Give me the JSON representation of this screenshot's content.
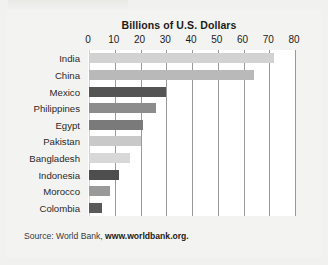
{
  "figure": {
    "source_prefix": "Source: World Bank, ",
    "source_link": "www.worldbank.org."
  },
  "chart_data": {
    "type": "bar",
    "orientation": "horizontal",
    "title": "Billions of U.S. Dollars",
    "xlabel": "",
    "ylabel": "",
    "xlim": [
      0,
      80
    ],
    "xticks": [
      0,
      10,
      20,
      30,
      40,
      50,
      60,
      70,
      80
    ],
    "tick_labels": [
      "0",
      "10",
      "20",
      "30",
      "40",
      "50",
      "60",
      "70",
      "80"
    ],
    "grid": true,
    "legend": "none",
    "categories": [
      "India",
      "China",
      "Mexico",
      "Philippines",
      "Egypt",
      "Pakistan",
      "Bangladesh",
      "Indonesia",
      "Morocco",
      "Colombia"
    ],
    "values": [
      72,
      64,
      30,
      26,
      21,
      20,
      16,
      11.5,
      8,
      5
    ],
    "bar_colors": [
      "#d2d2d2",
      "#b9b9b9",
      "#545454",
      "#8c8c8c",
      "#7a7a7a",
      "#c9c9c9",
      "#d8d8d8",
      "#4e4e4e",
      "#9a9a9a",
      "#5a5a5a"
    ]
  }
}
